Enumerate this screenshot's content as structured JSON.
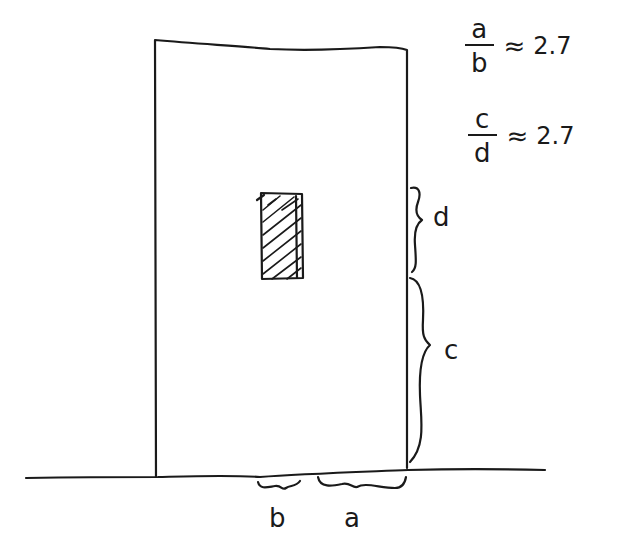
{
  "diagram": {
    "style": "hand-drawn sketch",
    "stroke_color": "#1a1a1a",
    "background": "#ffffff",
    "elements": {
      "ground_line": {
        "label": ""
      },
      "tall_rectangle": {
        "label": ""
      },
      "hatched_small_rectangle": {
        "label": ""
      }
    },
    "braces": {
      "a": {
        "label": "a",
        "orientation": "horizontal",
        "position": "below ground, right segment"
      },
      "b": {
        "label": "b",
        "orientation": "horizontal",
        "position": "below ground, left segment"
      },
      "c": {
        "label": "c",
        "orientation": "vertical",
        "position": "right of rectangle, lower segment"
      },
      "d": {
        "label": "d",
        "orientation": "vertical",
        "position": "right of rectangle, upper segment (aligned with hatched box)"
      }
    },
    "annotations": [
      {
        "numerator": "a",
        "denominator": "b",
        "relation": "≈",
        "value": "2.7"
      },
      {
        "numerator": "c",
        "denominator": "d",
        "relation": "≈",
        "value": "2.7"
      }
    ]
  }
}
